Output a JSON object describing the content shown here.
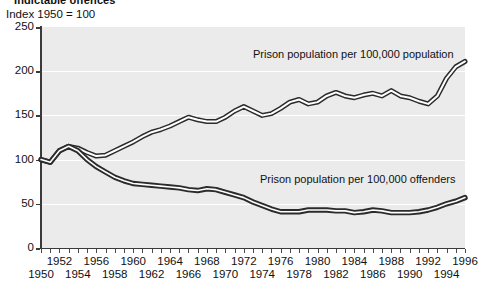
{
  "header": {
    "title": "Indictable offences",
    "subtitle": "Index 1950 = 100"
  },
  "annotations": {
    "upper": "Prison population per 100,000 population",
    "lower": "Prison population per 100,000 offenders"
  },
  "axes": {
    "y_ticks": [
      "0",
      "50",
      "100",
      "150",
      "200",
      "250"
    ],
    "x_labels_top": [
      "1952",
      "1956",
      "1960",
      "1964",
      "1968",
      "1972",
      "1976",
      "1980",
      "1984",
      "1988",
      "1992",
      "1996"
    ],
    "x_labels_bottom": [
      "1950",
      "1954",
      "1958",
      "1962",
      "1966",
      "1970",
      "1974",
      "1978",
      "1982",
      "1986",
      "1990",
      "1994"
    ]
  },
  "colors": {
    "plot_background": "#ebebeb",
    "gridline": "#ffffff",
    "axis": "#3a3a3a",
    "line_stroke": "#2b2b2b",
    "line_fill": "#ffffff",
    "text": "#111111"
  },
  "chart_data": {
    "type": "line",
    "title": "Indictable offences",
    "xlabel": "",
    "ylabel": "Index 1950 = 100",
    "ylim": [
      0,
      250
    ],
    "xlim": [
      1950,
      1996
    ],
    "grid": true,
    "legend": "inline-annotations",
    "x": [
      1950,
      1951,
      1952,
      1953,
      1954,
      1955,
      1956,
      1957,
      1958,
      1959,
      1960,
      1961,
      1962,
      1963,
      1964,
      1965,
      1966,
      1967,
      1968,
      1969,
      1970,
      1971,
      1972,
      1973,
      1974,
      1975,
      1976,
      1977,
      1978,
      1979,
      1980,
      1981,
      1982,
      1983,
      1984,
      1985,
      1986,
      1987,
      1988,
      1989,
      1990,
      1991,
      1992,
      1993,
      1994,
      1995,
      1996
    ],
    "series": [
      {
        "name": "Prison population per 100,000 population",
        "values": [
          100,
          97,
          110,
          115,
          113,
          108,
          104,
          105,
          110,
          115,
          120,
          126,
          131,
          134,
          138,
          143,
          148,
          145,
          143,
          143,
          148,
          155,
          160,
          155,
          150,
          152,
          158,
          165,
          168,
          163,
          165,
          172,
          176,
          172,
          170,
          173,
          175,
          172,
          178,
          172,
          170,
          166,
          163,
          172,
          192,
          205,
          211
        ]
      },
      {
        "name": "Prison population per 100,000 offenders",
        "values": [
          100,
          97,
          110,
          115,
          110,
          100,
          92,
          86,
          80,
          76,
          73,
          72,
          71,
          70,
          69,
          68,
          66,
          65,
          67,
          66,
          63,
          60,
          57,
          52,
          48,
          44,
          41,
          41,
          41,
          43,
          43,
          43,
          42,
          42,
          40,
          41,
          43,
          42,
          40,
          40,
          40,
          41,
          43,
          46,
          50,
          53,
          57
        ]
      }
    ]
  }
}
